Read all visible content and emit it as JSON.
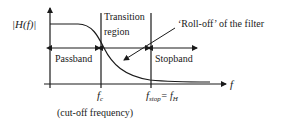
{
  "diagram": {
    "type": "lowpass-filter-response",
    "y_axis_label": "|H(f)|",
    "x_axis_label": "f",
    "regions": {
      "passband": "Passband",
      "transition": [
        "Transition",
        "region"
      ],
      "stopband": "Stopband"
    },
    "annotation": "‘Roll-off’ of the filter",
    "markers": {
      "cutoff": {
        "symbol": "f",
        "subscript": "c",
        "note": "(cut-off frequency)"
      },
      "stop": {
        "symbol": "f",
        "subscript": "stop",
        "equals": "= f",
        "equals_subscript": "H"
      }
    },
    "colors": {
      "line": "#1a1a1a",
      "background": "#ffffff"
    }
  }
}
